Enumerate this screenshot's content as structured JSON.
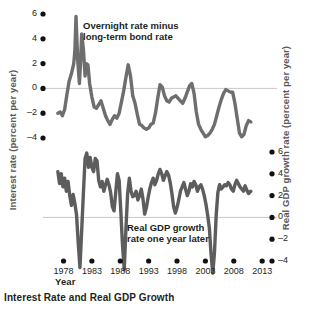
{
  "caption": "Interest Rate and Real GDP Growth",
  "chart_data": {
    "type": "line",
    "title": "Interest Rate and Real GDP Growth",
    "xlabel": "Year",
    "grid": false,
    "legend_position": "inline-annotation",
    "x_ticks": [
      "1978",
      "1983",
      "1988",
      "1993",
      "1998",
      "2003",
      "2008",
      "2013"
    ],
    "x_tick_values": [
      1978,
      1983,
      1988,
      1993,
      1998,
      2003,
      2008,
      2013
    ],
    "xlim": [
      1976.5,
      2013.5
    ],
    "axes": [
      {
        "id": "left",
        "label": "Interest rate (percent per year)",
        "ticks": [
          "6",
          "4",
          "2",
          "0",
          "–2",
          "–4"
        ],
        "tick_values": [
          6,
          4,
          2,
          0,
          -2,
          -4
        ],
        "ylim": [
          -4.6,
          6.6
        ],
        "zero_line": 0
      },
      {
        "id": "right",
        "label": "Real GDP growth rate (percent per year)",
        "ticks": [
          "6",
          "4",
          "2",
          "0",
          "–2",
          "–4"
        ],
        "tick_values": [
          6,
          4,
          2,
          0,
          -2,
          -4
        ],
        "ylim": [
          -5.2,
          7.2
        ],
        "zero_line": 0
      }
    ],
    "series": [
      {
        "name": "Overnight rate minus long-term bond rate",
        "annotation": "Overnight rate minus\nlong-term bond rate",
        "axis": "left",
        "color": "#6e6e6e",
        "x": [
          1977.0,
          1977.4,
          1977.8,
          1978.2,
          1978.6,
          1979.0,
          1979.4,
          1979.8,
          1980.0,
          1980.2,
          1980.5,
          1980.8,
          1981.0,
          1981.2,
          1981.5,
          1981.8,
          1982.0,
          1982.3,
          1982.6,
          1983.0,
          1983.4,
          1983.8,
          1984.2,
          1984.6,
          1985.0,
          1985.4,
          1985.8,
          1986.2,
          1986.6,
          1987.0,
          1987.4,
          1987.8,
          1988.2,
          1988.6,
          1989.0,
          1989.4,
          1989.8,
          1990.2,
          1990.6,
          1991.0,
          1991.4,
          1991.8,
          1992.2,
          1992.6,
          1993.0,
          1993.4,
          1993.8,
          1994.2,
          1994.6,
          1995.0,
          1995.4,
          1995.8,
          1996.2,
          1996.6,
          1997.0,
          1997.4,
          1997.8,
          1998.2,
          1998.6,
          1999.0,
          1999.4,
          1999.8,
          2000.2,
          2000.6,
          2001.0,
          2001.4,
          2001.8,
          2002.2,
          2002.6,
          2003.0,
          2003.4,
          2003.8,
          2004.2,
          2004.6,
          2005.0,
          2005.4,
          2005.8,
          2006.2,
          2006.6,
          2007.0,
          2007.4,
          2007.8,
          2008.2,
          2008.6,
          2009.0,
          2009.4,
          2009.8,
          2010.2,
          2010.6,
          2011.0
        ],
        "y": [
          -2.0,
          -1.9,
          -2.2,
          -1.7,
          -0.5,
          0.6,
          1.2,
          2.0,
          3.0,
          5.8,
          2.3,
          0.4,
          2.1,
          4.4,
          3.2,
          1.0,
          2.0,
          1.9,
          0.4,
          -0.7,
          -1.5,
          -1.6,
          -1.3,
          -1.0,
          -1.6,
          -2.2,
          -2.6,
          -2.9,
          -2.5,
          -2.2,
          -2.4,
          -2.0,
          -1.1,
          -0.2,
          0.9,
          1.9,
          1.0,
          -0.6,
          -1.2,
          -2.1,
          -2.9,
          -3.0,
          -3.2,
          -3.3,
          -3.2,
          -2.9,
          -2.8,
          -2.0,
          -0.8,
          0.3,
          0.1,
          -0.6,
          -1.0,
          -1.1,
          -0.8,
          -0.7,
          -0.6,
          -0.8,
          -1.0,
          -1.2,
          -0.8,
          -0.3,
          0.2,
          0.4,
          -0.4,
          -1.9,
          -2.9,
          -3.3,
          -3.6,
          -3.9,
          -3.8,
          -3.6,
          -3.3,
          -2.9,
          -2.2,
          -1.5,
          -0.9,
          -0.4,
          -0.1,
          -0.2,
          -0.3,
          -0.3,
          -1.2,
          -2.4,
          -3.6,
          -3.9,
          -3.7,
          -3.0,
          -2.6,
          -2.7
        ]
      },
      {
        "name": "Real GDP growth rate one year later",
        "annotation": "Real GDP growth\nrate one year later",
        "axis": "right",
        "color": "#5d5d5d",
        "x": [
          1977.0,
          1977.3,
          1977.6,
          1977.9,
          1978.2,
          1978.5,
          1978.8,
          1979.1,
          1979.4,
          1979.7,
          1980.0,
          1980.3,
          1980.6,
          1980.9,
          1981.2,
          1981.5,
          1981.8,
          1982.1,
          1982.4,
          1982.7,
          1983.0,
          1983.3,
          1983.6,
          1983.9,
          1984.2,
          1984.5,
          1984.8,
          1985.1,
          1985.4,
          1985.7,
          1986.0,
          1986.3,
          1986.6,
          1986.9,
          1987.2,
          1987.5,
          1987.8,
          1988.1,
          1988.4,
          1988.7,
          1989.0,
          1989.3,
          1989.6,
          1989.9,
          1990.2,
          1990.5,
          1990.8,
          1991.1,
          1991.4,
          1991.7,
          1992.0,
          1992.3,
          1992.6,
          1992.9,
          1993.2,
          1993.5,
          1993.8,
          1994.1,
          1994.4,
          1994.7,
          1995.0,
          1995.3,
          1995.6,
          1995.9,
          1996.2,
          1996.5,
          1996.8,
          1997.1,
          1997.4,
          1997.7,
          1998.0,
          1998.3,
          1998.6,
          1998.9,
          1999.2,
          1999.5,
          1999.8,
          2000.1,
          2000.4,
          2000.7,
          2001.0,
          2001.3,
          2001.6,
          2001.9,
          2002.2,
          2002.5,
          2002.8,
          2003.1,
          2003.4,
          2003.7,
          2004.0,
          2004.3,
          2004.6,
          2004.9,
          2005.2,
          2005.5,
          2005.8,
          2006.1,
          2006.4,
          2006.7,
          2007.0,
          2007.3,
          2007.6,
          2007.9,
          2008.2,
          2008.5,
          2008.8,
          2009.1,
          2009.4,
          2009.7,
          2010.0,
          2010.3,
          2010.6,
          2011.0
        ],
        "y": [
          4.2,
          3.1,
          4.0,
          2.8,
          3.6,
          2.4,
          3.3,
          2.0,
          1.1,
          2.1,
          1.3,
          0.2,
          -2.4,
          -4.6,
          -1.2,
          2.2,
          5.4,
          5.9,
          4.6,
          5.5,
          4.6,
          4.2,
          5.4,
          5.2,
          3.4,
          2.8,
          3.3,
          2.4,
          3.0,
          3.5,
          3.0,
          2.3,
          1.0,
          0.6,
          2.3,
          4.0,
          3.4,
          0.5,
          -2.6,
          -4.8,
          -1.0,
          2.2,
          3.6,
          2.4,
          1.9,
          2.0,
          2.4,
          1.6,
          2.0,
          2.6,
          1.7,
          0.3,
          0.9,
          1.8,
          2.6,
          3.2,
          3.6,
          3.0,
          3.4,
          4.0,
          4.4,
          4.0,
          3.4,
          3.8,
          4.2,
          3.9,
          3.2,
          2.2,
          1.0,
          0.4,
          0.9,
          1.6,
          2.4,
          2.8,
          3.2,
          2.6,
          2.0,
          2.4,
          3.1,
          2.8,
          3.3,
          3.0,
          2.4,
          2.8,
          3.0,
          2.6,
          2.0,
          1.2,
          0.2,
          -1.0,
          -3.4,
          -5.1,
          -3.2,
          0.2,
          2.3,
          3.0,
          2.6,
          2.8,
          3.0,
          2.9,
          3.2,
          3.0,
          2.6,
          2.4,
          3.0,
          3.4,
          3.1,
          2.8,
          2.6,
          2.4,
          2.9,
          2.5,
          2.2,
          2.4
        ]
      }
    ]
  },
  "annotations": {
    "overnight_line1": "Overnight rate minus",
    "overnight_line2": "long-term bond rate",
    "gdp_line1": "Real GDP growth",
    "gdp_line2": "rate one year later"
  },
  "colors": {
    "series_line": "#6e6e6e",
    "zero_line": "#c9c9c9",
    "tick_dot": "#111111",
    "axis_title": "#58585a",
    "text": "#231f20",
    "background": "#ffffff"
  }
}
